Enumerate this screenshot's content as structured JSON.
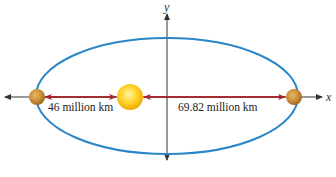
{
  "diagram": {
    "axes": {
      "x_label": "x",
      "y_label": "y"
    },
    "labels": {
      "perihelion_distance": "46 million km",
      "aphelion_distance": "69.82 million km"
    },
    "objects": {
      "sun": "sun",
      "planet_left": "planet at perihelion",
      "planet_right": "planet at aphelion"
    },
    "colors": {
      "orbit": "#2a86c8",
      "distance_arrow": "#a3262b",
      "axis": "#333333",
      "sun_core": "#ffd42a",
      "sun_edge": "#f0a800",
      "planet_core": "#d9a14a",
      "planet_edge": "#9b6420"
    }
  }
}
